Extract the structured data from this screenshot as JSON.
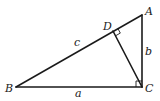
{
  "diagram": {
    "type": "right-triangle-with-altitude",
    "stroke_color": "#1a1a1a",
    "vertices": {
      "A": {
        "label": "A",
        "x": 142,
        "y": 15
      },
      "B": {
        "label": "B",
        "x": 16,
        "y": 87
      },
      "C": {
        "label": "C",
        "x": 142,
        "y": 87
      },
      "D": {
        "label": "D",
        "x": 113,
        "y": 31
      }
    },
    "sides": {
      "a": {
        "label": "a",
        "from": "B",
        "to": "C"
      },
      "b": {
        "label": "b",
        "from": "C",
        "to": "A"
      },
      "c": {
        "label": "c",
        "from": "B",
        "to": "A"
      }
    },
    "altitude": {
      "from": "C",
      "to": "D"
    },
    "right_angle_markers": [
      "D",
      "C"
    ]
  }
}
